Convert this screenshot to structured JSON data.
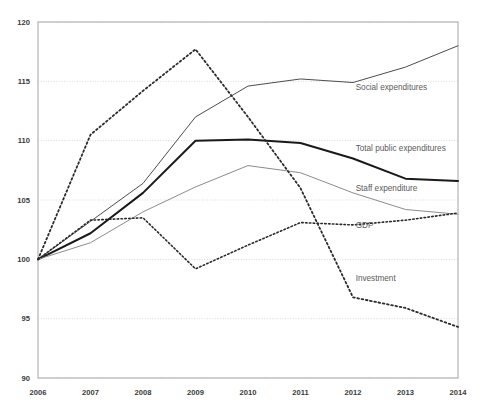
{
  "chart_data": {
    "type": "line",
    "title": "",
    "subtitle": "",
    "xlabel": "",
    "ylabel": "",
    "categories": [
      "2006",
      "2007",
      "2008",
      "2009",
      "2010",
      "2011",
      "2012",
      "2013",
      "2014"
    ],
    "x": [
      2006,
      2007,
      2008,
      2009,
      2010,
      2011,
      2012,
      2013,
      2014
    ],
    "xlim": [
      2006,
      2014
    ],
    "ylim": [
      90,
      120
    ],
    "yticks": [
      90,
      95,
      100,
      105,
      110,
      115,
      120
    ],
    "ytick_labels": [
      "90",
      "95",
      "100",
      "105",
      "110",
      "115",
      "120"
    ],
    "grid": true,
    "legend_position": "inline-right-of-series",
    "index_base": 100,
    "series": [
      {
        "name": "Social expenditures",
        "label": "Social expenditures",
        "style": "solid",
        "color": "#4d4d4d",
        "width": 1.0,
        "values": [
          100.0,
          103.2,
          106.4,
          112.0,
          114.6,
          115.2,
          114.9,
          116.2,
          118.0
        ],
        "label_x": 2012.05,
        "label_y": 114.3
      },
      {
        "name": "Total public expenditures",
        "label": "Total public expenditures",
        "style": "solid",
        "color": "#1a1a1a",
        "width": 2.0,
        "values": [
          100.0,
          102.2,
          105.6,
          110.0,
          110.1,
          109.8,
          108.5,
          106.8,
          106.6
        ],
        "label_x": 2012.05,
        "label_y": 109.1
      },
      {
        "name": "Staff expenditure",
        "label": "Staff expenditure",
        "style": "solid",
        "color": "#8c8c8c",
        "width": 1.0,
        "values": [
          100.0,
          101.4,
          104.0,
          106.1,
          107.9,
          107.3,
          105.6,
          104.2,
          103.8
        ],
        "label_x": 2012.05,
        "label_y": 105.8
      },
      {
        "name": "GDP",
        "label": "GDP",
        "style": "dotted",
        "color": "#2b2b2b",
        "width": 1.6,
        "values": [
          100.0,
          103.3,
          103.5,
          99.2,
          101.2,
          103.1,
          102.9,
          103.3,
          103.9
        ],
        "label_x": 2012.05,
        "label_y": 102.6
      },
      {
        "name": "Investment",
        "label": "Investment",
        "style": "dotted",
        "color": "#2b2b2b",
        "width": 1.8,
        "values": [
          100.0,
          110.5,
          114.2,
          117.7,
          112.0,
          106.0,
          96.8,
          95.9,
          94.3
        ],
        "label_x": 2012.05,
        "label_y": 98.2
      }
    ]
  },
  "plot": {
    "left": 38,
    "top": 22,
    "right": 458,
    "bottom": 378,
    "background": "#ffffff",
    "border_color": "#a6a6a6",
    "gridline_color": "#c8c8c8"
  }
}
